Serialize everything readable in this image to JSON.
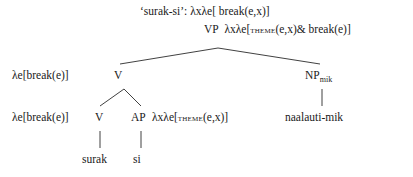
{
  "diagram": {
    "type": "syntactic-tree",
    "language_example": "surak-si",
    "background_color": "#ffffff",
    "line_color": "#2b2b2b",
    "text_color": "#1a1a1a"
  },
  "labels": {
    "root_gloss": "‘surak-si’: λxλe[ break(e,x)]",
    "vp_node": "VP",
    "vp_semantics_pre": "λxλe[",
    "vp_semantics_smallcaps": "theme",
    "vp_semantics_post": "(e,x)& break(e)]",
    "vbar_left_semantics": "λe[break(e)]",
    "vbar_node": "V",
    "np_node": "NP",
    "np_subscript": "mik",
    "v_left_semantics": "λe[break(e)]",
    "v_node": "V",
    "ap_node": "AP",
    "ap_semantics_pre": "λxλe[",
    "ap_semantics_smallcaps": "theme",
    "ap_semantics_post": "(e,x)]",
    "np_word": "naalauti-mik",
    "terminal_surak": "surak",
    "terminal_si": "si"
  },
  "edges": [
    {
      "name": "vp-to-vbar",
      "x1": 218,
      "y1": 48,
      "x2": 120,
      "y2": 64
    },
    {
      "name": "vp-to-np",
      "x1": 218,
      "y1": 48,
      "x2": 320,
      "y2": 64
    },
    {
      "name": "vbar-to-v",
      "x1": 124,
      "y1": 89,
      "x2": 100,
      "y2": 106
    },
    {
      "name": "vbar-to-ap",
      "x1": 124,
      "y1": 89,
      "x2": 141,
      "y2": 106
    },
    {
      "name": "np-to-word",
      "x1": 322,
      "y1": 89,
      "x2": 322,
      "y2": 106
    },
    {
      "name": "v-to-surak",
      "x1": 100,
      "y1": 131,
      "x2": 100,
      "y2": 148
    },
    {
      "name": "ap-to-si",
      "x1": 141,
      "y1": 131,
      "x2": 141,
      "y2": 148
    }
  ]
}
